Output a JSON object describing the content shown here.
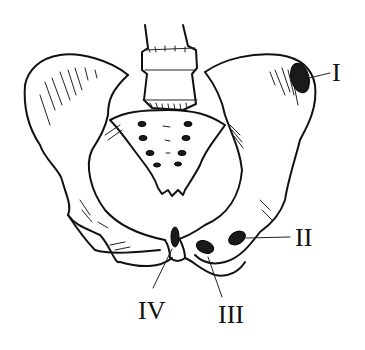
{
  "figure": {
    "labels": [
      {
        "id": "I",
        "text": "I",
        "x": 307,
        "y": 57
      },
      {
        "id": "II",
        "text": "II",
        "x": 297,
        "y": 228
      },
      {
        "id": "III",
        "text": "III",
        "x": 219,
        "y": 306
      },
      {
        "id": "IV",
        "text": "IV",
        "x": 140,
        "y": 300
      }
    ]
  },
  "colors": {
    "line": "#111111",
    "background": "#ffffff",
    "marker_fill": "#1a1a1a"
  }
}
